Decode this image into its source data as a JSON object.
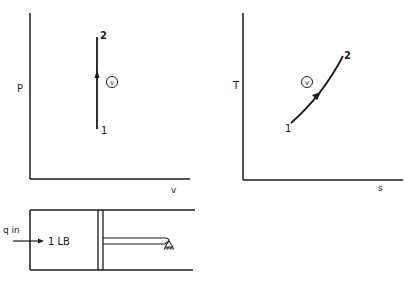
{
  "diagram": {
    "pv_chart": {
      "y_label": "P",
      "x_label": "v",
      "state_start": "1",
      "state_end": "2",
      "process_tag": "v"
    },
    "ts_chart": {
      "y_label": "T",
      "x_label": "s",
      "state_start": "1",
      "state_end": "2",
      "process_tag": "v"
    },
    "cylinder": {
      "heat_label": "q in",
      "mass_label": "1 LB"
    }
  },
  "colors": {
    "ink": "#1a1a1a",
    "background": "#ffffff"
  }
}
